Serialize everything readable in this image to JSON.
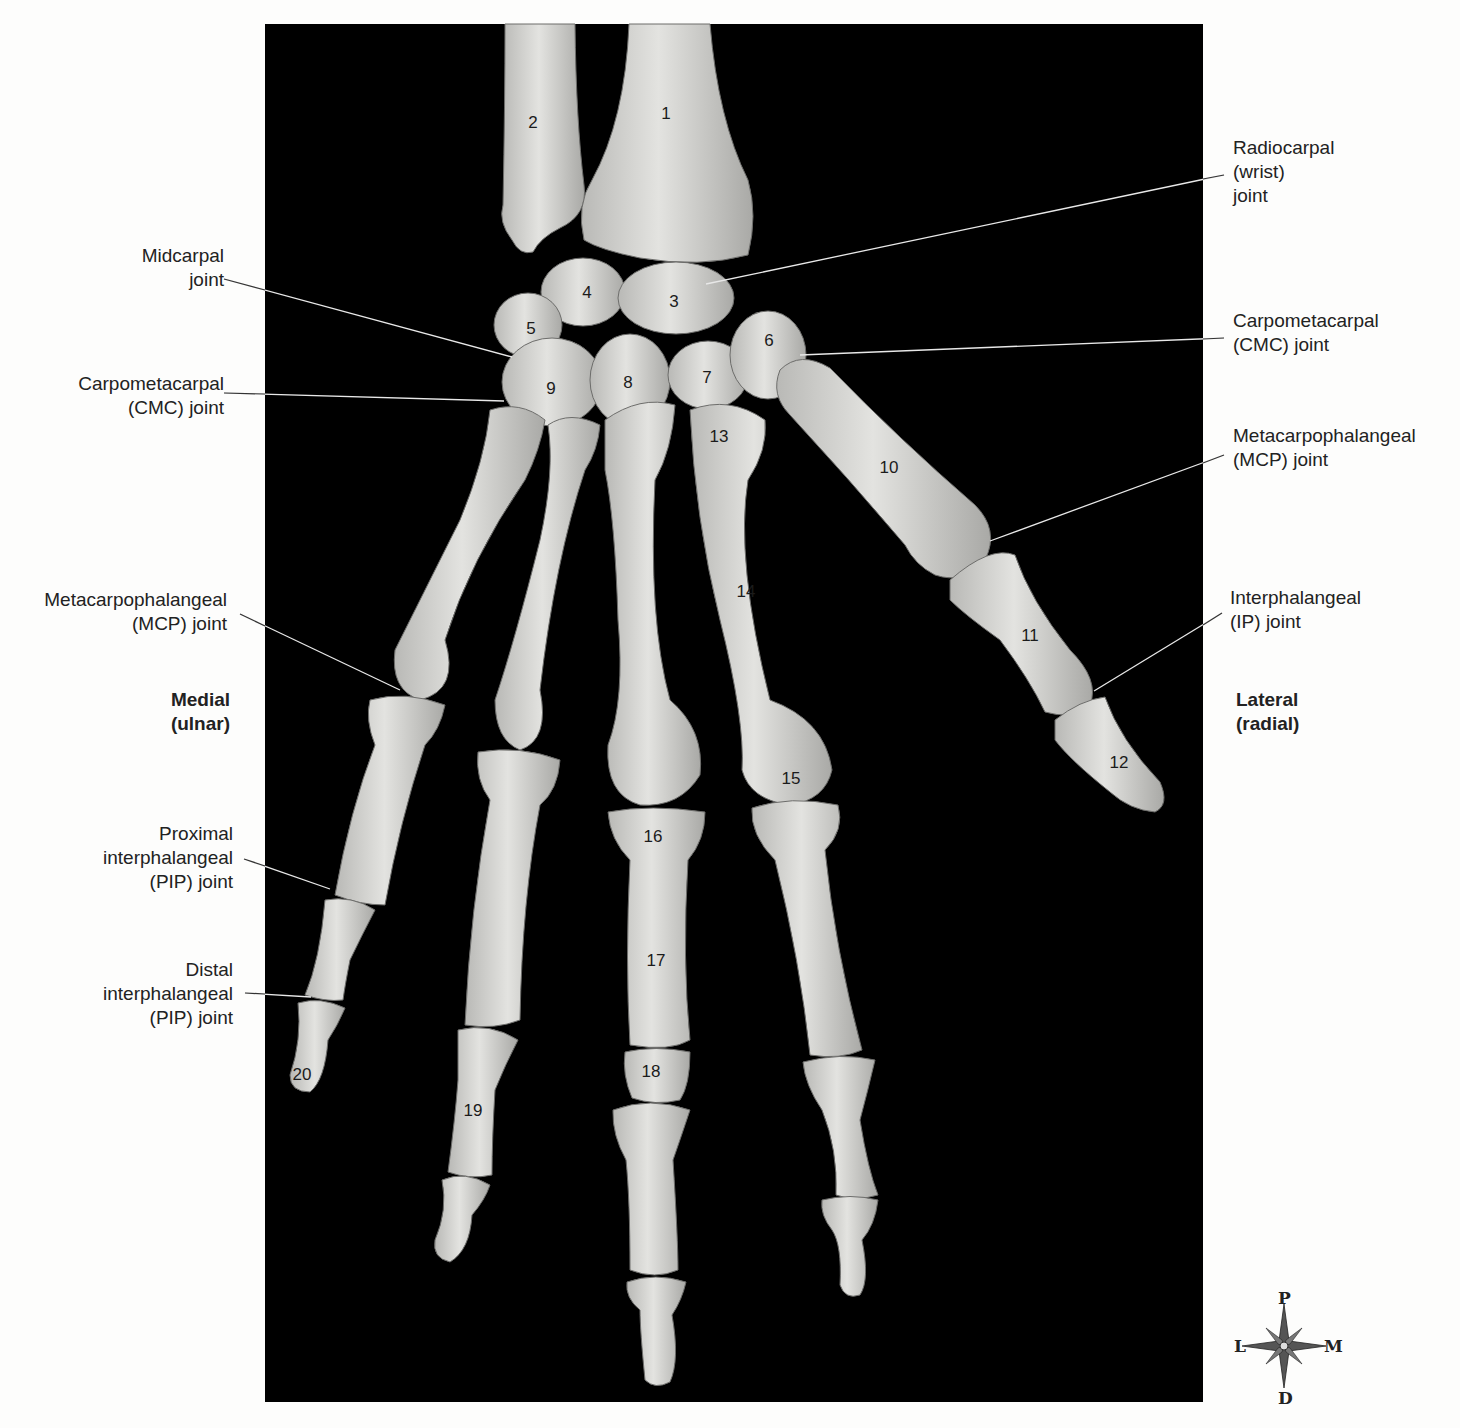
{
  "figure": {
    "view": "Dorsal view of right hand and wrist bones",
    "background_color": "#000000",
    "bone_color": "#d9d9d6",
    "label_color": "#222222",
    "leader_color": "#e8e8e8"
  },
  "bone_numbers": [
    {
      "id": "1",
      "x": 666,
      "y": 113
    },
    {
      "id": "2",
      "x": 533,
      "y": 122
    },
    {
      "id": "3",
      "x": 674,
      "y": 301
    },
    {
      "id": "4",
      "x": 587,
      "y": 292
    },
    {
      "id": "5",
      "x": 531,
      "y": 328
    },
    {
      "id": "6",
      "x": 769,
      "y": 340
    },
    {
      "id": "7",
      "x": 707,
      "y": 377
    },
    {
      "id": "8",
      "x": 628,
      "y": 382
    },
    {
      "id": "9",
      "x": 551,
      "y": 388
    },
    {
      "id": "10",
      "x": 889,
      "y": 467
    },
    {
      "id": "11",
      "x": 1030,
      "y": 635
    },
    {
      "id": "12",
      "x": 1119,
      "y": 762
    },
    {
      "id": "13",
      "x": 719,
      "y": 436
    },
    {
      "id": "14",
      "x": 746,
      "y": 591
    },
    {
      "id": "15",
      "x": 791,
      "y": 778
    },
    {
      "id": "16",
      "x": 653,
      "y": 836
    },
    {
      "id": "17",
      "x": 656,
      "y": 960
    },
    {
      "id": "18",
      "x": 651,
      "y": 1071
    },
    {
      "id": "19",
      "x": 473,
      "y": 1110
    },
    {
      "id": "20",
      "x": 302,
      "y": 1074
    }
  ],
  "labels_left": [
    {
      "name": "midcarpal-joint",
      "text": "Midcarpal\njoint",
      "x": 40,
      "y": 244,
      "w": 184,
      "line": [
        224,
        279,
        512,
        357
      ]
    },
    {
      "name": "cmc-joint-left",
      "text": "Carpometacarpal\n(CMC) joint",
      "x": 20,
      "y": 372,
      "w": 204,
      "line": [
        224,
        393,
        504,
        401
      ]
    },
    {
      "name": "mcp-joint-left",
      "text": "Metacarpophalangeal\n(MCP) joint",
      "x": 0,
      "y": 588,
      "w": 227,
      "line": [
        240,
        614,
        400,
        690
      ]
    },
    {
      "name": "pip-joint",
      "text": "Proximal\ninterphalangeal\n(PIP) joint",
      "x": 40,
      "y": 822,
      "w": 193,
      "line": [
        244,
        859,
        330,
        889
      ]
    },
    {
      "name": "dip-joint",
      "text": "Distal\ninterphalangeal\n(PIP) joint",
      "x": 40,
      "y": 958,
      "w": 193,
      "line": [
        245,
        993,
        311,
        997
      ]
    }
  ],
  "labels_right": [
    {
      "name": "radiocarpal-joint",
      "text": "Radiocarpal\n(wrist)\njoint",
      "x": 1233,
      "y": 136,
      "line": [
        1224,
        175,
        706,
        284
      ]
    },
    {
      "name": "cmc-joint-right",
      "text": "Carpometacarpal\n(CMC) joint",
      "x": 1233,
      "y": 309,
      "line": [
        1224,
        338,
        800,
        355
      ]
    },
    {
      "name": "mcp-joint-right",
      "text": "Metacarpophalangeal\n(MCP) joint",
      "x": 1233,
      "y": 424,
      "line": [
        1224,
        455,
        990,
        541
      ]
    },
    {
      "name": "ip-joint",
      "text": "Interphalangeal\n(IP) joint",
      "x": 1230,
      "y": 586,
      "line": [
        1222,
        613,
        1094,
        691
      ]
    }
  ],
  "orientation": {
    "medial": "Medial\n(ulnar)",
    "lateral": "Lateral\n(radial)"
  },
  "compass": {
    "top": "P",
    "bottom": "D",
    "left": "L",
    "right": "M"
  }
}
